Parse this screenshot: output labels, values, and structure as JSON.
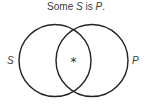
{
  "title": {
    "prefix": "Some ",
    "subject": "S",
    "middle": " is ",
    "predicate": "P",
    "suffix": "."
  },
  "diagram": {
    "type": "venn",
    "circles": [
      {
        "label": "S",
        "cx": 55,
        "cy": 60.5,
        "r": 36
      },
      {
        "label": "P",
        "cx": 92,
        "cy": 60.5,
        "r": 36
      }
    ],
    "marker": {
      "symbol": "*",
      "region": "S∩P"
    },
    "stroke_color": "#222222"
  }
}
